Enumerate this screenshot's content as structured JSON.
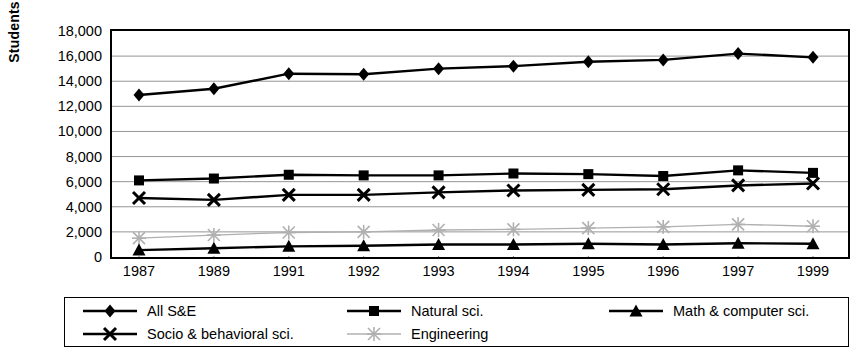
{
  "chart_data": {
    "type": "line",
    "title": "",
    "xlabel": "",
    "ylabel": "Students",
    "categories": [
      "1987",
      "1989",
      "1991",
      "1992",
      "1993",
      "1994",
      "1995",
      "1996",
      "1997",
      "1999"
    ],
    "ylim": [
      0,
      18000
    ],
    "ytick_labels": [
      "18,000",
      "16,000",
      "14,000",
      "12,000",
      "10,000",
      "8,000",
      "6,000",
      "4,000",
      "2,000",
      "0"
    ],
    "ytick_values": [
      18000,
      16000,
      14000,
      12000,
      10000,
      8000,
      6000,
      4000,
      2000,
      0
    ],
    "grid": true,
    "legend_position": "bottom",
    "series": [
      {
        "name": "All S&E",
        "marker": "diamond",
        "color": "#000000",
        "values": [
          12900,
          13400,
          14600,
          14550,
          15000,
          15200,
          15550,
          15700,
          16200,
          15900
        ]
      },
      {
        "name": "Natural sci.",
        "marker": "square",
        "color": "#000000",
        "values": [
          6100,
          6250,
          6550,
          6500,
          6500,
          6650,
          6600,
          6450,
          6900,
          6700
        ]
      },
      {
        "name": "Math & computer sci.",
        "marker": "triangle",
        "color": "#000000",
        "values": [
          550,
          700,
          850,
          900,
          1000,
          1000,
          1050,
          1000,
          1100,
          1050
        ]
      },
      {
        "name": "Socio & behavioral sci.",
        "marker": "x",
        "color": "#000000",
        "values": [
          4700,
          4550,
          4950,
          4950,
          5150,
          5300,
          5350,
          5400,
          5700,
          5850
        ]
      },
      {
        "name": "Engineering",
        "marker": "star",
        "color": "#b0b0b0",
        "values": [
          1500,
          1750,
          1950,
          2000,
          2150,
          2200,
          2300,
          2400,
          2600,
          2450
        ]
      }
    ]
  }
}
